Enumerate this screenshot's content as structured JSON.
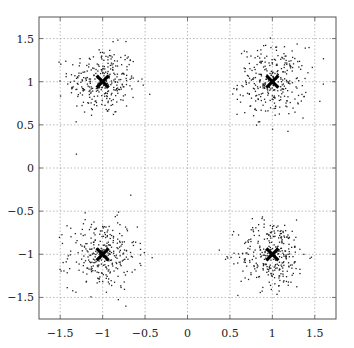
{
  "chart_data": {
    "type": "scatter",
    "title": "",
    "xlabel": "",
    "ylabel": "",
    "xlim": [
      -1.75,
      1.75
    ],
    "ylim": [
      -1.75,
      1.75
    ],
    "grid": true,
    "legend": null,
    "x_ticks": [
      -1.5,
      -1,
      -0.5,
      0,
      0.5,
      1,
      1.5
    ],
    "x_tick_labels": [
      "−1.5",
      "−1",
      "−0.5",
      "0",
      "0.5",
      "1",
      "1.5"
    ],
    "y_ticks": [
      1.5,
      1,
      0.5,
      0,
      -0.5,
      -1,
      -1.5
    ],
    "y_tick_labels": [
      "1.5",
      "1",
      "0.5",
      "0",
      "−0.5",
      "−1",
      "−1.5"
    ],
    "series": [
      {
        "name": "samples cluster 1",
        "marker": "dot",
        "color": "#222222",
        "center": [
          -1,
          1
        ],
        "std": 0.2,
        "count": 300
      },
      {
        "name": "samples cluster 2",
        "marker": "dot",
        "color": "#222222",
        "center": [
          1,
          1
        ],
        "std": 0.2,
        "count": 300
      },
      {
        "name": "samples cluster 3",
        "marker": "dot",
        "color": "#222222",
        "center": [
          -1,
          -1
        ],
        "std": 0.2,
        "count": 300
      },
      {
        "name": "samples cluster 4",
        "marker": "dot",
        "color": "#222222",
        "center": [
          1,
          -1
        ],
        "std": 0.2,
        "count": 300
      },
      {
        "name": "cluster centers",
        "marker": "x",
        "color": "#000000",
        "x": [
          -1,
          1,
          -1,
          1
        ],
        "y": [
          1,
          1,
          -1,
          -1
        ]
      }
    ]
  },
  "plot_area": {
    "left": 39,
    "top": 17,
    "right": 336,
    "bottom": 319
  },
  "colors": {
    "frame": "#555555",
    "grid": "#aaaaaa",
    "points": "#222222",
    "centers": "#000000"
  }
}
